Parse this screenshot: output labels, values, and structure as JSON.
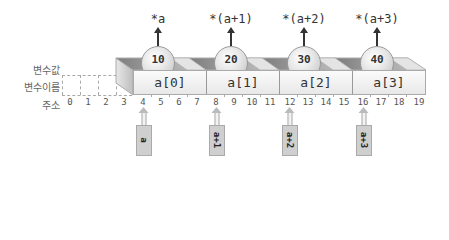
{
  "row_labels": {
    "value": "변수값",
    "name": "변수이름",
    "address": "주소"
  },
  "elements": [
    {
      "name": "a[0]",
      "value": "10",
      "deref": "*a",
      "pointer": "a",
      "address_start": 4
    },
    {
      "name": "a[1]",
      "value": "20",
      "deref": "*(a+1)",
      "pointer": "a+1",
      "address_start": 8
    },
    {
      "name": "a[2]",
      "value": "30",
      "deref": "*(a+2)",
      "pointer": "a+2",
      "address_start": 12
    },
    {
      "name": "a[3]",
      "value": "40",
      "deref": "*(a+3)",
      "pointer": "a+3",
      "address_start": 16
    }
  ],
  "addresses": [
    "0",
    "1",
    "2",
    "3",
    "4",
    "5",
    "6",
    "7",
    "8",
    "9",
    "10",
    "11",
    "12",
    "13",
    "14",
    "15",
    "16",
    "17",
    "18",
    "19"
  ],
  "colors": {
    "block_front": "#f0f0f0",
    "block_top_dark": "#8c8c8c",
    "ball": "#dddddd",
    "pointer_box": "#cfcfcf",
    "arrow": "#333333"
  }
}
